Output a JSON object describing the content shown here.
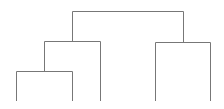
{
  "diagram": {
    "type": "dendrogram",
    "line_color": "#777777",
    "background": "#ffffff",
    "leaves": [
      {
        "id": "leaf-1",
        "x": 16
      },
      {
        "id": "leaf-2",
        "x": 72
      },
      {
        "id": "leaf-3",
        "x": 100
      },
      {
        "id": "leaf-4",
        "x": 155
      },
      {
        "id": "leaf-5",
        "x": 210
      }
    ],
    "leaf_baseline_y": 101,
    "merges": [
      {
        "id": "merge-a",
        "left_x": 16,
        "right_x": 72,
        "y": 71,
        "left_bottom": 101,
        "right_bottom": 101
      },
      {
        "id": "merge-b",
        "left_x": 44,
        "right_x": 100,
        "y": 41,
        "left_bottom": 71,
        "right_bottom": 101
      },
      {
        "id": "merge-c",
        "left_x": 155,
        "right_x": 210,
        "y": 42,
        "left_bottom": 101,
        "right_bottom": 101
      },
      {
        "id": "merge-root",
        "left_x": 72,
        "right_x": 183,
        "y": 11,
        "left_bottom": 41,
        "right_bottom": 42
      }
    ]
  }
}
